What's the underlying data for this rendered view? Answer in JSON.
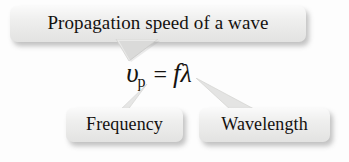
{
  "figure": {
    "background_color": "#fdfdfd",
    "callout_fill_color": "#ececeb",
    "text_color": "#14110f"
  },
  "callouts": {
    "top": {
      "label": "Propagation speed of a wave",
      "points_to": "v_p"
    },
    "frequency": {
      "label": "Frequency",
      "points_to": "f"
    },
    "wavelength": {
      "label": "Wavelength",
      "points_to": "lambda"
    }
  },
  "formula": {
    "full": "v_p = fλ",
    "variable_symbol": "υ",
    "variable_subscript": "p",
    "operator": "=",
    "frequency_symbol": "f",
    "wavelength_symbol": "λ"
  },
  "icons": {
    "tail_top": "callout-tail-down-icon",
    "tail_frequency": "callout-tail-up-icon",
    "tail_wavelength": "callout-tail-up-left-icon"
  }
}
